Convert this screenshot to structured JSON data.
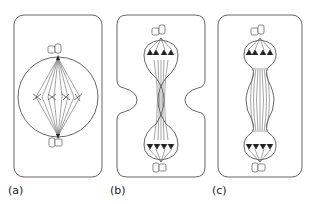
{
  "figure": {
    "panels": [
      {
        "id": "a",
        "label": "(a)",
        "stage": "metaphase"
      },
      {
        "id": "b",
        "label": "(b)",
        "stage": "anaphase-telophase with cleavage furrow"
      },
      {
        "id": "c",
        "label": "(c)",
        "stage": "anaphase with elongating spindle"
      }
    ],
    "colors": {
      "outline": "#555555",
      "chromosome": "#222222",
      "background": "#ffffff"
    }
  }
}
